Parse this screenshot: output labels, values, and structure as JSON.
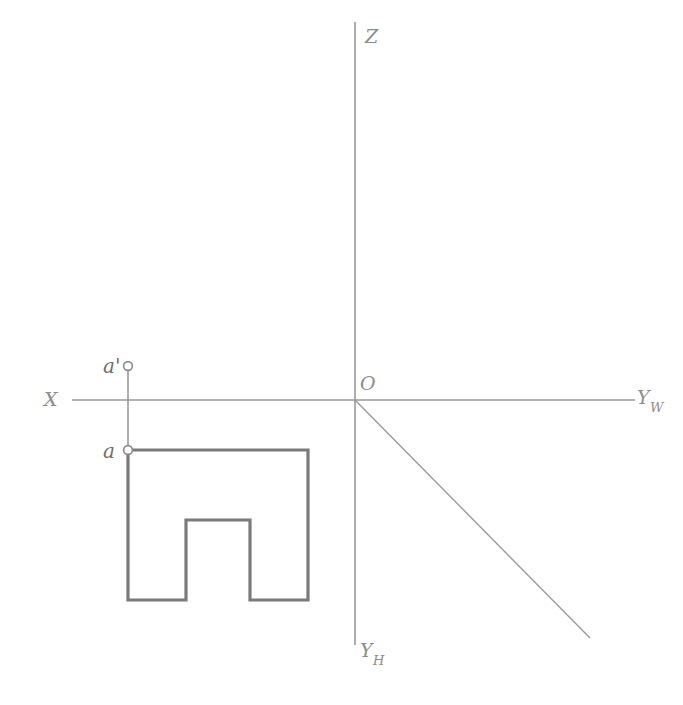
{
  "figure": {
    "title_strip": "求作形体的侧面投影",
    "background_color": "#ffffff",
    "axis_color": "#9a9a9a",
    "shape_color": "#7a7a7a",
    "label_color": "#8c8c8c",
    "point_color": "#6f6f6f"
  },
  "axes": {
    "origin": {
      "label": "O",
      "x": 355,
      "y": 400
    },
    "z_axis": {
      "label": "Z",
      "from": [
        355,
        22
      ],
      "to": [
        355,
        400
      ]
    },
    "yh_axis": {
      "label": "Y",
      "subscript": "H",
      "from": [
        355,
        400
      ],
      "to": [
        355,
        645
      ]
    },
    "x_axis": {
      "label": "X",
      "from": [
        72,
        400
      ],
      "to": [
        355,
        400
      ]
    },
    "yw_axis": {
      "label": "Y",
      "subscript": "W",
      "from": [
        355,
        400
      ],
      "to": [
        635,
        400
      ]
    },
    "y_diagonal": {
      "from": [
        355,
        400
      ],
      "to": [
        590,
        638
      ]
    }
  },
  "points": [
    {
      "name": "a-prime",
      "label": "a'",
      "marker": "open-circle",
      "cx": 128,
      "cy": 366,
      "label_x": 105,
      "label_y": 372,
      "description": "front projection point above X axis"
    },
    {
      "name": "a",
      "label": "a",
      "marker": "open-circle",
      "cx": 128,
      "cy": 450,
      "label_x": 105,
      "label_y": 458,
      "description": "top projection point at corner of U shape"
    }
  ],
  "projector": {
    "name": "vertical-projector",
    "from": [
      128,
      366
    ],
    "to": [
      128,
      450
    ]
  },
  "u_shape": {
    "name": "u-shaped-top-view",
    "outline_points": "128,450 308,450 308,600 250,600 250,520 186,520 186,600 128,600",
    "bounds": {
      "left": 128,
      "top": 450,
      "right": 308,
      "bottom": 600
    },
    "notch": {
      "left": 186,
      "top": 520,
      "right": 250,
      "bottom": 600
    }
  }
}
